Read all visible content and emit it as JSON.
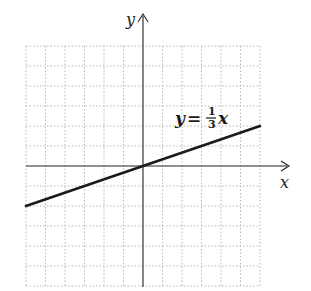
{
  "chart_data": {
    "type": "line",
    "title": "",
    "xlabel": "x",
    "ylabel": "y",
    "grid": true,
    "xlim": [
      -6,
      6
    ],
    "ylim": [
      -6,
      6
    ],
    "series": [
      {
        "name": "y = 1/3 x",
        "equation": "y = (1/3)x",
        "slope": 0.3333,
        "intercept": 0,
        "x": [
          -6,
          0,
          6
        ],
        "y": [
          -2,
          0,
          2
        ]
      }
    ],
    "annotations": [
      {
        "text": "y = 1/3 x",
        "position": "upper right, above line"
      }
    ]
  },
  "labels": {
    "x_axis": "x",
    "y_axis": "y",
    "equation": {
      "lhs": "y",
      "equals": "=",
      "numerator": "1",
      "denominator": "3",
      "var": "x"
    }
  },
  "colors": {
    "line": "#1a1a1a",
    "axes": "#222222",
    "grid": "#b8b8b8",
    "background": "#ffffff"
  }
}
